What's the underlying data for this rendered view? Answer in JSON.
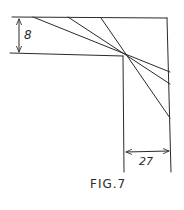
{
  "figure": {
    "caption": "FIG.7",
    "stroke_color": "#2a2a2a",
    "background": "#ffffff",
    "dimensions": {
      "vertical": {
        "label": "8"
      },
      "horizontal": {
        "label": "27"
      }
    },
    "outline": {
      "top_edge": {
        "x1": 12,
        "y1": 17,
        "x2": 167,
        "y2": 18
      },
      "right_edge": {
        "x1": 167,
        "y1": 18,
        "x2": 171,
        "y2": 172
      },
      "lower_edge": {
        "x1": 10,
        "y1": 53,
        "x2": 123,
        "y2": 56
      },
      "inner_vertical": {
        "x1": 123,
        "y1": 56,
        "x2": 124,
        "y2": 172
      }
    },
    "pivot": {
      "x": 123,
      "y": 56
    },
    "diagonal_lines": [
      {
        "x1": 33,
        "y1": 17,
        "x2": 170,
        "y2": 72
      },
      {
        "x1": 68,
        "y1": 17,
        "x2": 170,
        "y2": 84
      },
      {
        "x1": 101,
        "y1": 18,
        "x2": 170,
        "y2": 118
      }
    ]
  }
}
